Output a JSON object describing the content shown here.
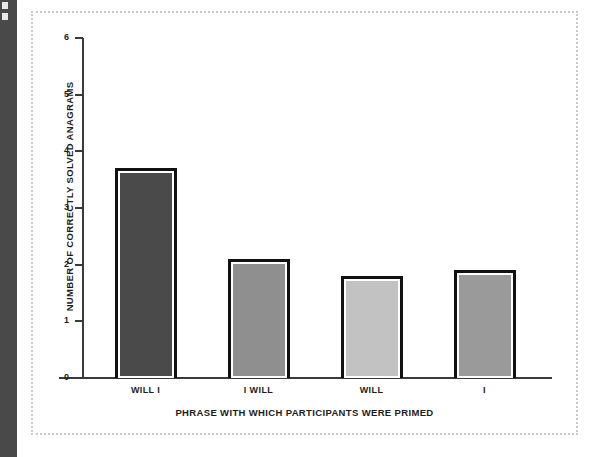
{
  "page": {
    "background_color": "#ffffff",
    "binding_strip_color": "#494949",
    "frame_border_color": "#c9c9c9"
  },
  "chart_data": {
    "type": "bar",
    "title": "",
    "subtitle": "",
    "xlabel": "PHRASE WITH WHICH PARTICIPANTS WERE PRIMED",
    "ylabel": "NUMBER OF CORRECTLY SOLVED ANAGRAMS",
    "categories": [
      "WILL I",
      "I WILL",
      "WILL",
      "I"
    ],
    "values": [
      3.7,
      2.1,
      1.8,
      1.9
    ],
    "ylim": [
      0,
      6
    ],
    "yticks": [
      0,
      1,
      2,
      3,
      4,
      5,
      6
    ],
    "ytick_labels": [
      "0",
      "1",
      "2",
      "3",
      "4",
      "5",
      "6"
    ],
    "grid": false,
    "legend": false,
    "legend_position": "none",
    "bar_colors": [
      "#4a4a4a",
      "#8f8f8f",
      "#c2c2c2",
      "#9a9a9a"
    ],
    "bar_border_color": "#111111",
    "bar_inner_border_color": "#ffffff",
    "series": [
      {
        "name": "Number of correctly solved anagrams",
        "values": [
          3.7,
          2.1,
          1.8,
          1.9
        ]
      }
    ]
  }
}
